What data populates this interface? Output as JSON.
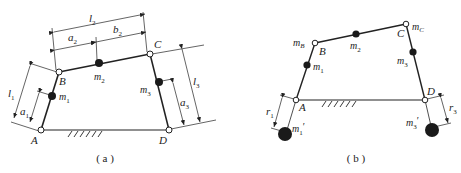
{
  "diagram": {
    "type": "four-bar linkage mass substitution",
    "panels": [
      {
        "id": "a",
        "caption": "( a )",
        "joints": {
          "A": "A",
          "B": "B",
          "C": "C",
          "D": "D"
        },
        "masses": {
          "m1": "m",
          "m1_sub": "1",
          "m2": "m",
          "m2_sub": "2",
          "m3": "m",
          "m3_sub": "3"
        },
        "dimensions": {
          "l1": "l",
          "l1_sub": "1",
          "a1": "a",
          "a1_sub": "1",
          "l2": "l",
          "l2_sub": "2",
          "a2": "a",
          "a2_sub": "2",
          "b2": "b",
          "b2_sub": "2",
          "l3": "l",
          "l3_sub": "3",
          "a3": "a",
          "a3_sub": "3"
        }
      },
      {
        "id": "b",
        "caption": "( b )",
        "joints": {
          "A": "A",
          "B": "B",
          "C": "C",
          "D": "D"
        },
        "masses": {
          "mB": "m",
          "mB_sub": "B",
          "mC": "m",
          "mC_sub": "C",
          "m1": "m",
          "m1_sub": "1",
          "m2": "m",
          "m2_sub": "2",
          "m3": "m",
          "m3_sub": "3",
          "m1p": "m",
          "m1p_sub": "1",
          "m1p_prime": "′",
          "m3p": "m",
          "m3p_sub": "3",
          "m3p_prime": "′"
        },
        "dimensions": {
          "r1": "r",
          "r1_sub": "1",
          "r3": "r",
          "r3_sub": "3"
        }
      }
    ],
    "colors": {
      "line": "#222222",
      "mass": "#1a1a1a",
      "joint_fill": "#ffffff"
    }
  }
}
